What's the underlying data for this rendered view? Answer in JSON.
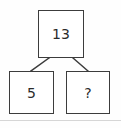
{
  "diagram": {
    "type": "number-bond",
    "nodes": [
      {
        "id": "sum",
        "role": "whole",
        "value": "13",
        "position": "top"
      },
      {
        "id": "addend-left",
        "role": "part",
        "value": "5",
        "position": "bottom-left"
      },
      {
        "id": "addend-right",
        "role": "part",
        "value": "?",
        "position": "bottom-right"
      }
    ],
    "connectors": [
      {
        "from": "sum",
        "to": "addend-left"
      },
      {
        "from": "sum",
        "to": "addend-right"
      }
    ],
    "colors": {
      "box_border": "#3c3c3c",
      "box_fill": "#ffffff",
      "text": "#2b2b2b",
      "connector": "#3c3c3c",
      "background": "#fefefe",
      "divider": "#d6d6d6"
    }
  }
}
